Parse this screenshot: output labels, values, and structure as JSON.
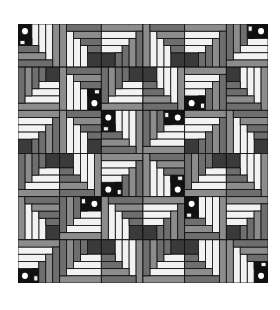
{
  "figure": {
    "type": "log-cabin quilt pattern",
    "grid_rows": 6,
    "grid_cols": 6,
    "colors": {
      "black": "#111111",
      "dark_gray": "#3a3a3a",
      "mid_gray": "#6e6e6e",
      "light_gray": "#8c8c8c",
      "white": "#f2f2f2",
      "dot": "#ffffff"
    },
    "blocks": [
      [
        {
          "corner": "tl",
          "dot": true
        },
        {
          "corner": "br",
          "dot": false
        },
        {
          "corner": "bl",
          "dot": false
        },
        {
          "corner": "br",
          "dot": false
        },
        {
          "corner": "bl",
          "dot": false
        },
        {
          "corner": "tr",
          "dot": true
        }
      ],
      [
        {
          "corner": "tr",
          "dot": false
        },
        {
          "corner": "br",
          "dot": true
        },
        {
          "corner": "tr",
          "dot": false
        },
        {
          "corner": "tl",
          "dot": false
        },
        {
          "corner": "bl",
          "dot": true
        },
        {
          "corner": "tl",
          "dot": false
        }
      ],
      [
        {
          "corner": "bl",
          "dot": false
        },
        {
          "corner": "br",
          "dot": false
        },
        {
          "corner": "tl",
          "dot": true
        },
        {
          "corner": "tr",
          "dot": true
        },
        {
          "corner": "bl",
          "dot": false
        },
        {
          "corner": "br",
          "dot": false
        }
      ],
      [
        {
          "corner": "tr",
          "dot": false
        },
        {
          "corner": "tl",
          "dot": false
        },
        {
          "corner": "bl",
          "dot": true
        },
        {
          "corner": "br",
          "dot": true
        },
        {
          "corner": "tr",
          "dot": false
        },
        {
          "corner": "tl",
          "dot": false
        }
      ],
      [
        {
          "corner": "br",
          "dot": false
        },
        {
          "corner": "tr",
          "dot": true
        },
        {
          "corner": "br",
          "dot": false
        },
        {
          "corner": "bl",
          "dot": false
        },
        {
          "corner": "tl",
          "dot": true
        },
        {
          "corner": "bl",
          "dot": false
        }
      ],
      [
        {
          "corner": "bl",
          "dot": true
        },
        {
          "corner": "tr",
          "dot": false
        },
        {
          "corner": "tl",
          "dot": false
        },
        {
          "corner": "tr",
          "dot": false
        },
        {
          "corner": "tl",
          "dot": false
        },
        {
          "corner": "br",
          "dot": true
        }
      ]
    ]
  }
}
